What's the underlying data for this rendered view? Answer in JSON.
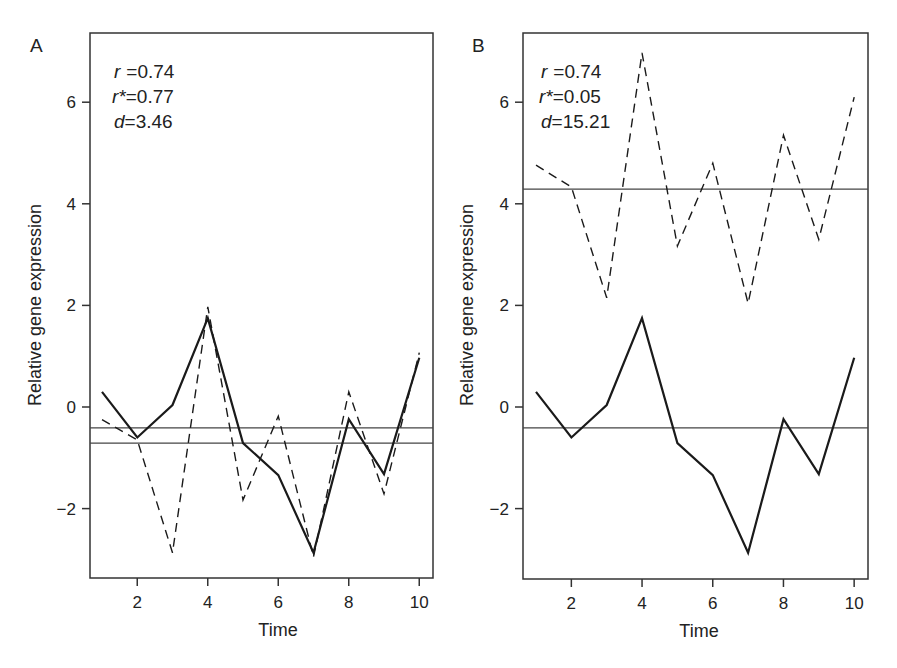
{
  "chart_data": [
    {
      "type": "line",
      "panel": "A",
      "xlabel": "Time",
      "ylabel": "Relative gene expression",
      "x": [
        1,
        2,
        3,
        4,
        5,
        6,
        7,
        8,
        9,
        10
      ],
      "xticks": [
        2,
        4,
        6,
        8,
        10
      ],
      "yticks": [
        -2,
        0,
        2,
        4,
        6
      ],
      "xlim": [
        0.65,
        10.4
      ],
      "ylim": [
        -3.4,
        7.4
      ],
      "stats": {
        "r": "0.74",
        "r_star": "0.77",
        "d": "3.46"
      },
      "series": [
        {
          "name": "gene 1",
          "style": "solid",
          "values": [
            0.3,
            -0.6,
            0.04,
            1.75,
            -0.71,
            -1.34,
            -2.87,
            -0.24,
            -1.32,
            0.97
          ]
        },
        {
          "name": "gene 2",
          "style": "dashed",
          "values": [
            -0.25,
            -0.65,
            -2.87,
            1.97,
            -1.83,
            -0.18,
            -2.95,
            0.3,
            -1.71,
            1.07
          ]
        }
      ],
      "hlines": [
        {
          "name": "mean gene 1",
          "y": -0.41
        },
        {
          "name": "mean gene 2",
          "y": -0.71
        }
      ],
      "grid": false
    },
    {
      "type": "line",
      "panel": "B",
      "xlabel": "Time",
      "ylabel": "Relative gene expression",
      "x": [
        1,
        2,
        3,
        4,
        5,
        6,
        7,
        8,
        9,
        10
      ],
      "xticks": [
        2,
        4,
        6,
        8,
        10
      ],
      "yticks": [
        -2,
        0,
        2,
        4,
        6
      ],
      "xlim": [
        0.65,
        10.4
      ],
      "ylim": [
        -3.4,
        7.4
      ],
      "stats": {
        "r": "0.74",
        "r_star": "0.05",
        "d": "15.21"
      },
      "series": [
        {
          "name": "gene 1",
          "style": "solid",
          "values": [
            0.3,
            -0.6,
            0.04,
            1.75,
            -0.71,
            -1.34,
            -2.87,
            -0.24,
            -1.32,
            0.97
          ]
        },
        {
          "name": "gene 2",
          "style": "dashed",
          "values": [
            4.76,
            4.33,
            2.15,
            6.97,
            3.17,
            4.8,
            2.04,
            5.35,
            3.3,
            6.1
          ]
        }
      ],
      "hlines": [
        {
          "name": "mean gene 1",
          "y": -0.41
        },
        {
          "name": "mean gene 2",
          "y": 4.29
        }
      ],
      "grid": false
    }
  ],
  "panels": [
    {
      "letter": "A",
      "stat_r_label": "r",
      "stat_r_value": "=0.74",
      "stat_rstar_label": "r*",
      "stat_rstar_value": "=0.77",
      "stat_d_label": "d",
      "stat_d_value": "=3.46",
      "xlabel": "Time",
      "ylabel": "Relative gene expression"
    },
    {
      "letter": "B",
      "stat_r_label": "r",
      "stat_r_value": "=0.74",
      "stat_rstar_label": "r*",
      "stat_rstar_value": "=0.05",
      "stat_d_label": "d",
      "stat_d_value": "=15.21",
      "xlabel": "Time",
      "ylabel": "Relative gene expression"
    }
  ],
  "colors": {
    "line": "#1a1a1a",
    "axis": "#333333",
    "hline": "#444444"
  }
}
